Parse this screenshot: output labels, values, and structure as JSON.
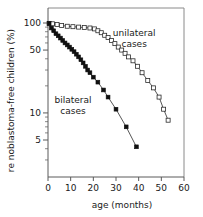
{
  "chart_data": {
    "type": "line",
    "title": "",
    "xlabel": "age (months)",
    "ylabel": "retinoblastoma-free children (%)",
    "ylabel_visible": "re  noblastoma-free children (%)",
    "yscale": "log",
    "xlim": [
      0,
      60
    ],
    "ylim": [
      3,
      110
    ],
    "grid": false,
    "xticks": [
      0,
      10,
      20,
      30,
      40,
      50,
      60
    ],
    "xticklabels": [
      "0",
      "10",
      "20",
      "30",
      "40",
      "50",
      "60"
    ],
    "yticks": [
      100,
      50,
      10,
      5
    ],
    "yticklabels": [
      "100",
      "50",
      "10",
      "5"
    ],
    "yminor": [
      90,
      80,
      70,
      60,
      40,
      30,
      20,
      9,
      8,
      7,
      6,
      4,
      3
    ],
    "legend_position": "inline-annotations",
    "series": [
      {
        "name": "unilateral cases",
        "marker": "open-square",
        "label_x": 38,
        "label_y": 72,
        "points": [
          [
            0.5,
            99
          ],
          [
            2.0,
            98
          ],
          [
            4.0,
            96
          ],
          [
            6.0,
            94
          ],
          [
            8.5,
            92
          ],
          [
            11.0,
            91
          ],
          [
            13.5,
            90
          ],
          [
            16.0,
            89
          ],
          [
            18.5,
            88
          ],
          [
            20.5,
            86
          ],
          [
            22.0,
            82
          ],
          [
            23.5,
            78
          ],
          [
            25.0,
            73
          ],
          [
            26.5,
            69
          ],
          [
            28.0,
            64
          ],
          [
            29.5,
            59
          ],
          [
            31.0,
            54
          ],
          [
            32.5,
            50
          ],
          [
            34.0,
            46
          ],
          [
            35.5,
            42
          ],
          [
            37.5,
            38
          ],
          [
            39.5,
            33
          ],
          [
            41.5,
            28
          ],
          [
            44.0,
            23
          ],
          [
            46.5,
            19
          ],
          [
            49.0,
            15
          ],
          [
            51.0,
            11
          ],
          [
            53.0,
            8.3
          ]
        ]
      },
      {
        "name": "bilateral cases",
        "marker": "filled-square",
        "label_x": 11,
        "label_y": 13,
        "points": [
          [
            0.5,
            99
          ],
          [
            1.5,
            88
          ],
          [
            2.5,
            82
          ],
          [
            3.5,
            76
          ],
          [
            4.5,
            72
          ],
          [
            5.5,
            68
          ],
          [
            6.5,
            64
          ],
          [
            7.5,
            60
          ],
          [
            8.5,
            57
          ],
          [
            9.5,
            54
          ],
          [
            10.5,
            51
          ],
          [
            11.5,
            48
          ],
          [
            12.5,
            45
          ],
          [
            13.5,
            42
          ],
          [
            14.5,
            39
          ],
          [
            15.5,
            36
          ],
          [
            16.5,
            33
          ],
          [
            17.5,
            30
          ],
          [
            18.5,
            28
          ],
          [
            20.0,
            25
          ],
          [
            22.0,
            22
          ],
          [
            24.5,
            18
          ],
          [
            26.5,
            15
          ],
          [
            30.0,
            11
          ],
          [
            34.5,
            7.0
          ],
          [
            39.0,
            4.2
          ]
        ]
      }
    ]
  }
}
